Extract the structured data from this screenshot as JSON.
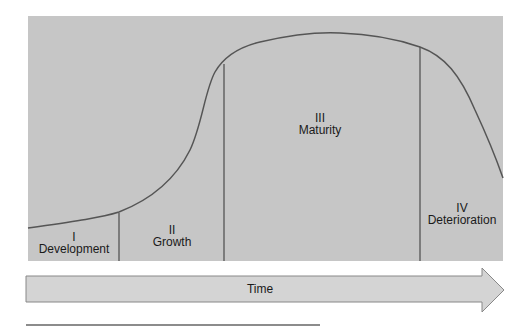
{
  "diagram": {
    "type": "lifecycle-curve",
    "colors": {
      "panel": "#c6c6c6",
      "arrow": "#d4d4d4",
      "curve": "#555555",
      "divider": "#333333",
      "text": "#1a1a1a"
    },
    "stages": [
      {
        "numeral": "I",
        "name": "Development"
      },
      {
        "numeral": "II",
        "name": "Growth"
      },
      {
        "numeral": "III",
        "name": "Maturity"
      },
      {
        "numeral": "IV",
        "name": "Deterioration"
      }
    ],
    "axis": {
      "label": "Time"
    }
  }
}
